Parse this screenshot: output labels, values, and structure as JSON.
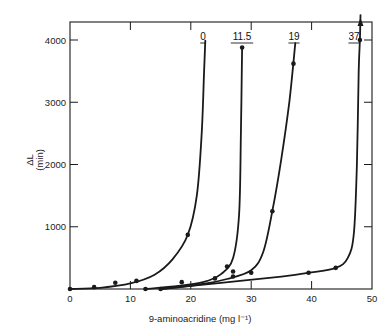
{
  "chart_data": {
    "type": "line",
    "title": "",
    "xlabel": "9-aminoacridine (mg l⁻¹)",
    "ylabel": "ΔL",
    "ylabel_unit": "(min)",
    "xlim": [
      0,
      50
    ],
    "ylim": [
      0,
      4300
    ],
    "xticks": [
      0,
      10,
      20,
      30,
      40,
      50
    ],
    "yticks": [
      1000,
      2000,
      3000,
      4000
    ],
    "grid": false,
    "legend": "inline labels at top of each curve",
    "series": [
      {
        "name": "0",
        "points": [
          [
            0,
            0
          ],
          [
            4,
            30
          ],
          [
            7.5,
            100
          ],
          [
            11,
            130
          ],
          [
            19.5,
            870
          ]
        ],
        "curve": [
          [
            0,
            0
          ],
          [
            5,
            20
          ],
          [
            10,
            90
          ],
          [
            14,
            230
          ],
          [
            17,
            480
          ],
          [
            19.5,
            870
          ],
          [
            21,
            1500
          ],
          [
            21.8,
            2500
          ],
          [
            22.2,
            3500
          ],
          [
            22.4,
            3990
          ]
        ]
      },
      {
        "name": "11.5",
        "points": [
          [
            12.5,
            0
          ],
          [
            15,
            0
          ],
          [
            18.5,
            110
          ],
          [
            24,
            170
          ],
          [
            26,
            360
          ],
          [
            27,
            280
          ],
          [
            28.5,
            3880
          ]
        ],
        "curve": [
          [
            12.5,
            0
          ],
          [
            18,
            50
          ],
          [
            22,
            110
          ],
          [
            25,
            240
          ],
          [
            27,
            500
          ],
          [
            28,
            1200
          ],
          [
            28.3,
            2500
          ],
          [
            28.5,
            3880
          ]
        ]
      },
      {
        "name": "19",
        "points": [
          [
            27,
            200
          ],
          [
            30,
            260
          ],
          [
            33.5,
            1250
          ],
          [
            37,
            3620
          ]
        ],
        "curve": [
          [
            15,
            0
          ],
          [
            22,
            80
          ],
          [
            26,
            160
          ],
          [
            30,
            300
          ],
          [
            32,
            600
          ],
          [
            33.5,
            1250
          ],
          [
            35,
            2100
          ],
          [
            36.3,
            3000
          ],
          [
            37.3,
            3950
          ]
        ]
      },
      {
        "name": "37",
        "points": [
          [
            39.5,
            260
          ],
          [
            44,
            340
          ],
          [
            48,
            4000
          ]
        ],
        "curve": [
          [
            15,
            0
          ],
          [
            25,
            100
          ],
          [
            35,
            200
          ],
          [
            39.5,
            260
          ],
          [
            44,
            340
          ],
          [
            46,
            500
          ],
          [
            47,
            900
          ],
          [
            47.5,
            2000
          ],
          [
            47.8,
            3500
          ],
          [
            48,
            4000
          ],
          [
            48.1,
            4400
          ]
        ]
      }
    ],
    "series_labels": [
      "0",
      "11.5",
      "19",
      "37"
    ],
    "annotations": [
      "arrow at top of '37' curve indicating values exceeding plot range"
    ]
  }
}
